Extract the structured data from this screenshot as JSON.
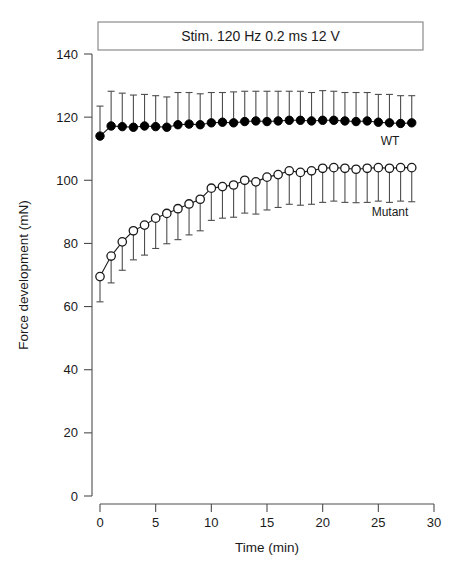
{
  "figure": {
    "panel_title": "Stim. 120 Hz 0.2 ms 12 V",
    "xlabel": "Time (min)",
    "ylabel": "Force development (mN)",
    "label_wt": "WT",
    "label_mutant": "Mutant"
  },
  "chart_data": {
    "type": "line",
    "title": "Stim. 120 Hz 0.2 ms 12 V",
    "xlabel": "Time (min)",
    "ylabel": "Force development (mN)",
    "xlim": [
      0,
      30
    ],
    "ylim": [
      0,
      140
    ],
    "xticks": [
      0,
      5,
      10,
      15,
      20,
      25,
      30
    ],
    "yticks": [
      0,
      20,
      40,
      60,
      80,
      100,
      120,
      140
    ],
    "grid": false,
    "legend_position": "inline-right-of-series",
    "error_bars": "SD, WT drawn upward only, Mutant drawn downward only",
    "x": [
      0,
      1,
      2,
      3,
      4,
      5,
      6,
      7,
      8,
      9,
      10,
      11,
      12,
      13,
      14,
      15,
      16,
      17,
      18,
      19,
      20,
      21,
      22,
      23,
      24,
      25,
      26,
      27,
      28
    ],
    "series": [
      {
        "name": "WT",
        "marker": "filled-circle",
        "values": [
          114.0,
          117.2,
          117.0,
          116.8,
          117.2,
          117.0,
          116.8,
          117.6,
          117.8,
          117.6,
          118.2,
          118.4,
          118.2,
          118.6,
          118.8,
          118.6,
          118.8,
          119.0,
          119.0,
          118.8,
          119.0,
          119.0,
          118.8,
          118.6,
          118.8,
          118.4,
          118.2,
          118.0,
          118.2
        ],
        "error_up": [
          9.5,
          11.0,
          10.6,
          10.2,
          10.0,
          9.8,
          9.6,
          10.2,
          10.0,
          9.8,
          9.6,
          9.4,
          9.8,
          9.6,
          9.4,
          9.6,
          9.4,
          9.2,
          9.2,
          9.0,
          9.4,
          9.2,
          9.0,
          9.2,
          9.0,
          8.8,
          9.0,
          8.8,
          8.6
        ],
        "error_down": [
          0,
          0,
          0,
          0,
          0,
          0,
          0,
          0,
          0,
          0,
          0,
          0,
          0,
          0,
          0,
          0,
          0,
          0,
          0,
          0,
          0,
          0,
          0,
          0,
          0,
          0,
          0,
          0,
          0
        ]
      },
      {
        "name": "Mutant",
        "marker": "open-circle",
        "values": [
          69.5,
          76.0,
          80.5,
          84.0,
          85.8,
          88.0,
          89.5,
          91.0,
          92.5,
          94.0,
          97.5,
          98.0,
          98.5,
          100.0,
          99.5,
          101.0,
          101.8,
          103.0,
          102.5,
          103.0,
          103.8,
          104.0,
          103.8,
          103.5,
          103.8,
          104.0,
          103.8,
          104.0,
          104.0
        ],
        "error_up": [
          0,
          0,
          0,
          0,
          0,
          0,
          0,
          0,
          0,
          0,
          0,
          0,
          0,
          0,
          0,
          0,
          0,
          0,
          0,
          0,
          0,
          0,
          0,
          0,
          0,
          0,
          0,
          0,
          0
        ],
        "error_down": [
          8.0,
          8.5,
          9.0,
          9.2,
          9.5,
          9.6,
          9.6,
          9.8,
          9.8,
          10.0,
          10.2,
          10.0,
          10.2,
          10.4,
          10.2,
          10.4,
          10.4,
          10.6,
          10.4,
          10.6,
          10.8,
          10.6,
          10.8,
          10.6,
          10.8,
          10.6,
          10.8,
          10.6,
          10.8
        ]
      }
    ]
  },
  "colors": {
    "axis": "#4d4d4d",
    "wt_marker": "#000000",
    "mutant_marker": "#ffffff",
    "mutant_stroke": "#1a1a1a",
    "title_box_border": "#808080",
    "background": "#ffffff"
  }
}
